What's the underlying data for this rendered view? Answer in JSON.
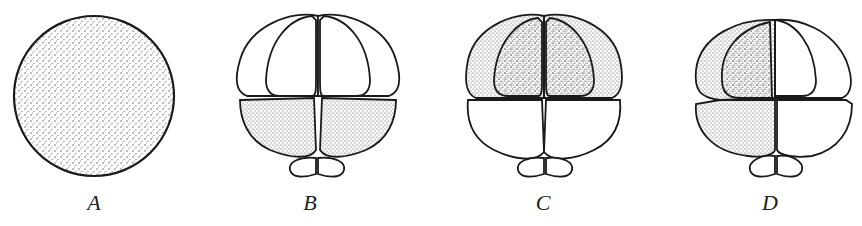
{
  "figure": {
    "panels": [
      {
        "id": "A",
        "label": "A",
        "description": "uncleaved egg, stippled throughout"
      },
      {
        "id": "B",
        "label": "B",
        "description": "8-cell stage with polar lobe; lower (vegetal) blastomeres shaded"
      },
      {
        "id": "C",
        "label": "C",
        "description": "8-cell stage with polar lobe; upper (animal) blastomeres shaded"
      },
      {
        "id": "D",
        "label": "D",
        "description": "8-cell stage with polar lobe; left quartet shaded (upper and lower)"
      }
    ]
  },
  "colors": {
    "ink": "#1a1a1a",
    "paper": "#ffffff",
    "stipple": "#555555"
  }
}
